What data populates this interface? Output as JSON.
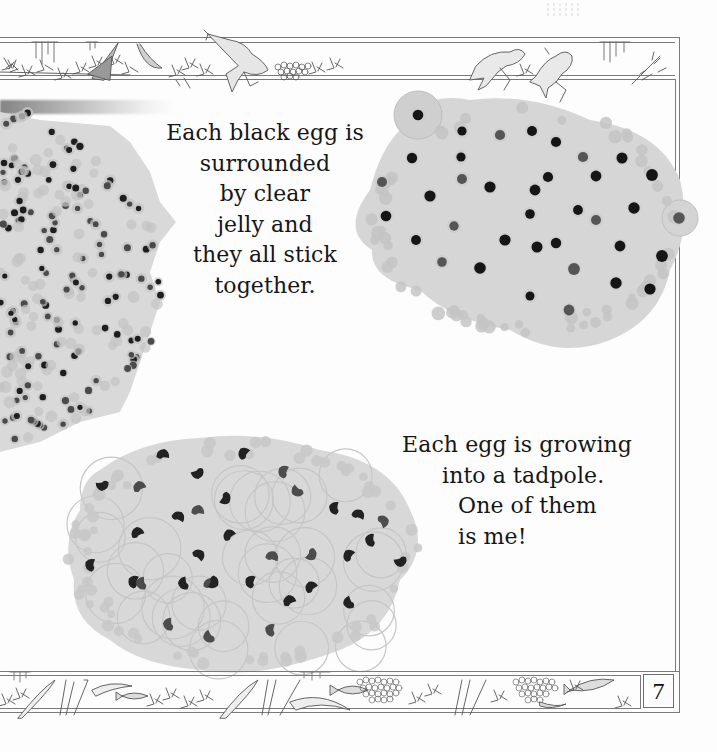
{
  "page": {
    "type": "children's picture book page",
    "page_number": "7",
    "background": "#fdfdfd",
    "frame_color": "#7a7a7a"
  },
  "top_frieze": {
    "illustrations": [
      "pondweed",
      "water-skater",
      "water-boatman",
      "leaping-frog",
      "frogspawn-clump",
      "two-frogs",
      "pondweed-sprig"
    ]
  },
  "bottom_frieze": {
    "illustrations": [
      "pondweed",
      "reeds",
      "small-fish",
      "reeds",
      "fish",
      "frogspawn-clump",
      "reeds",
      "frogspawn-clump",
      "fish",
      "pondweed-sprig"
    ]
  },
  "captions": [
    {
      "id": "caption-jelly",
      "lines": [
        "Each black egg is",
        "surrounded",
        "by clear",
        "jelly and",
        "they all stick",
        "together."
      ]
    },
    {
      "id": "caption-tadpole",
      "lines": [
        "Each egg is growing",
        "into a tadpole.",
        "One of them",
        "is me!"
      ]
    }
  ],
  "images": [
    {
      "id": "frogspawn-mass-left",
      "description": "Large mass of frogspawn with many small black eggs"
    },
    {
      "id": "frogspawn-close-up",
      "description": "Close-up of frogspawn, black eggs in clear jelly"
    },
    {
      "id": "developing-tadpole-eggs",
      "description": "Frogspawn with curled developing tadpole embryos"
    }
  ]
}
